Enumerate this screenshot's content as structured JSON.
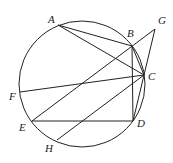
{
  "diagram": {
    "type": "geometry",
    "circle": {
      "cx": 82,
      "cy": 84,
      "r": 63
    },
    "points": {
      "A": {
        "label": "A",
        "x": 58,
        "y": 25,
        "lx": 48,
        "ly": 23
      },
      "B": {
        "label": "B",
        "x": 132,
        "y": 46,
        "lx": 127,
        "ly": 37
      },
      "C": {
        "label": "C",
        "x": 144,
        "y": 75,
        "lx": 148,
        "ly": 80
      },
      "D": {
        "label": "D",
        "x": 133,
        "y": 121,
        "lx": 137,
        "ly": 127
      },
      "E": {
        "label": "E",
        "x": 32,
        "y": 121,
        "lx": 19,
        "ly": 131
      },
      "F": {
        "label": "F",
        "x": 20,
        "y": 92,
        "lx": 9,
        "ly": 100
      },
      "G": {
        "label": "G",
        "x": 155,
        "y": 29,
        "lx": 158,
        "ly": 24
      },
      "H": {
        "label": "H",
        "x": 57,
        "y": 140,
        "lx": 45,
        "ly": 152
      }
    },
    "segments": [
      [
        "A",
        "B"
      ],
      [
        "A",
        "C"
      ],
      [
        "B",
        "C"
      ],
      [
        "B",
        "D"
      ],
      [
        "C",
        "D"
      ],
      [
        "E",
        "G"
      ],
      [
        "G",
        "C"
      ],
      [
        "F",
        "C"
      ],
      [
        "H",
        "C"
      ],
      [
        "E",
        "D"
      ]
    ]
  }
}
